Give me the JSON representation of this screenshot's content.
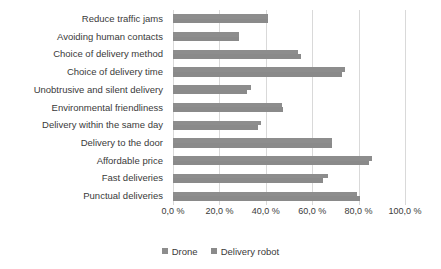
{
  "chart_data": {
    "type": "bar",
    "orientation": "horizontal",
    "title": "",
    "subtitle": "",
    "xlabel": "",
    "ylabel": "",
    "xlim": [
      0,
      100
    ],
    "xticks": [
      0,
      20,
      40,
      60,
      80,
      100
    ],
    "xtick_labels": [
      "0,0 %",
      "20,0 %",
      "40,0 %",
      "60,0 %",
      "80,0 %",
      "100,0 %"
    ],
    "grid": true,
    "grid_axis": "x",
    "legend_position": "bottom",
    "categories": [
      "Reduce traffic jams",
      "Avoiding human contacts",
      "Choice of delivery method",
      "Choice of delivery time",
      "Unobtrusive and silent delivery",
      "Environmental friendliness",
      "Delivery within the same day",
      "Delivery to the door",
      "Affordable price",
      "Fast deliveries",
      "Punctual deliveries"
    ],
    "series": [
      {
        "name": "Drone",
        "color": "#8d8d8d",
        "values": [
          41.0,
          28.5,
          54.0,
          74.0,
          33.5,
          47.0,
          38.0,
          68.5,
          85.8,
          67.0,
          79.3
        ]
      },
      {
        "name": "Delivery robot",
        "color": "#8a8a8a",
        "values": [
          41.0,
          28.5,
          55.0,
          73.0,
          32.0,
          47.5,
          36.5,
          68.5,
          84.5,
          64.7,
          80.5
        ]
      }
    ]
  },
  "legend": {
    "items": [
      {
        "label": "Drone",
        "color": "#8d8d8d"
      },
      {
        "label": "Delivery robot",
        "color": "#8a8a8a"
      }
    ]
  },
  "axis": {
    "x_tick_labels": [
      "0,0 %",
      "20,0 %",
      "40,0 %",
      "60,0 %",
      "80,0 %",
      "100,0 %"
    ]
  }
}
